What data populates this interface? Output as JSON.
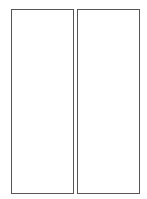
{
  "panels": [
    {
      "id": "left",
      "content": ""
    },
    {
      "id": "right",
      "content": ""
    }
  ],
  "colors": {
    "border": "#555555",
    "background": "#ffffff"
  }
}
